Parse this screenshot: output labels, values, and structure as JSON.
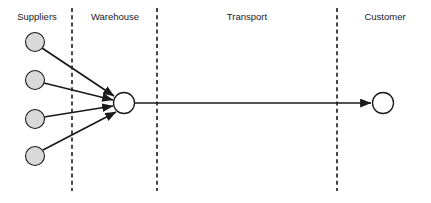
{
  "diagram": {
    "type": "flow-diagram",
    "canvas": {
      "width": 431,
      "height": 203,
      "background": "#ffffff"
    },
    "colors": {
      "supplier_fill": "#d9d9d9",
      "node_fill": "#ffffff",
      "stroke": "#1a1a1a",
      "divider": "#1a1a1a",
      "label_text": "#1a1a1a"
    },
    "zones": [
      {
        "id": "suppliers",
        "label": "Suppliers",
        "label_x": 37,
        "label_y": 17
      },
      {
        "id": "warehouse",
        "label": "Warehouse",
        "label_x": 115,
        "label_y": 17
      },
      {
        "id": "transport",
        "label": "Transport",
        "label_x": 247,
        "label_y": 17
      },
      {
        "id": "customer",
        "label": "Customer",
        "label_x": 385,
        "label_y": 17
      }
    ],
    "dividers": [
      {
        "id": "divider-suppliers-warehouse",
        "x": 72,
        "y1": 8,
        "y2": 191
      },
      {
        "id": "divider-warehouse-transport",
        "x": 157,
        "y1": 8,
        "y2": 191
      },
      {
        "id": "divider-transport-customer",
        "x": 337,
        "y1": 8,
        "y2": 191
      }
    ],
    "nodes": {
      "suppliers": [
        {
          "id": "supplier-1",
          "cx": 35,
          "cy": 42,
          "r": 9.5,
          "fill": "#d9d9d9"
        },
        {
          "id": "supplier-2",
          "cx": 35,
          "cy": 80,
          "r": 9.5,
          "fill": "#d9d9d9"
        },
        {
          "id": "supplier-3",
          "cx": 35,
          "cy": 119,
          "r": 9.5,
          "fill": "#d9d9d9"
        },
        {
          "id": "supplier-4",
          "cx": 35,
          "cy": 156,
          "r": 9.5,
          "fill": "#d9d9d9"
        }
      ],
      "warehouse": {
        "id": "warehouse-node",
        "cx": 124,
        "cy": 103,
        "r": 10.5,
        "fill": "#ffffff"
      },
      "customer": {
        "id": "customer-node",
        "cx": 383,
        "cy": 103,
        "r": 10.5,
        "fill": "#ffffff"
      }
    },
    "edges": [
      {
        "id": "edge-supplier-1-warehouse",
        "x1": 42,
        "y1": 48,
        "x2": 114,
        "y2": 96,
        "arrow": true
      },
      {
        "id": "edge-supplier-2-warehouse",
        "x1": 44,
        "y1": 83,
        "x2": 113,
        "y2": 100,
        "arrow": true
      },
      {
        "id": "edge-supplier-3-warehouse",
        "x1": 44,
        "y1": 117,
        "x2": 113,
        "y2": 106,
        "arrow": true
      },
      {
        "id": "edge-supplier-4-warehouse",
        "x1": 43,
        "y1": 150,
        "x2": 116,
        "y2": 112,
        "arrow": true
      },
      {
        "id": "edge-warehouse-customer",
        "x1": 135,
        "y1": 103,
        "x2": 371,
        "y2": 103,
        "arrow": true
      }
    ]
  }
}
